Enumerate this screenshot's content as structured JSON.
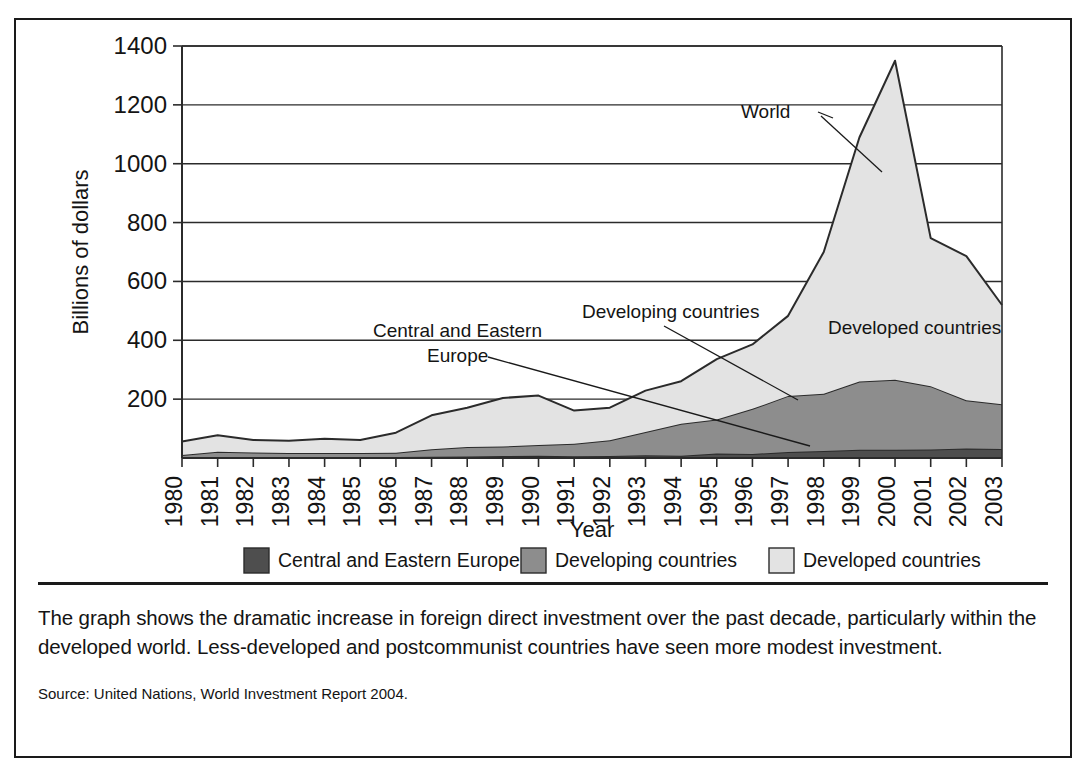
{
  "chart_data": {
    "type": "area",
    "stacked": true,
    "title": "",
    "xlabel": "Year",
    "ylabel": "Billions of dollars",
    "x": [
      1980,
      1981,
      1982,
      1983,
      1984,
      1985,
      1986,
      1987,
      1988,
      1989,
      1990,
      1991,
      1992,
      1993,
      1994,
      1995,
      1996,
      1997,
      1998,
      1999,
      2000,
      2001,
      2002,
      2003
    ],
    "xtick_labels": [
      "1980",
      "1981",
      "1982",
      "1983",
      "1984",
      "1985",
      "1986",
      "1987",
      "1988",
      "1989",
      "1990",
      "1991",
      "1992",
      "1993",
      "1994",
      "1995",
      "1996",
      "1997",
      "1998",
      "1999",
      "2000",
      "2001",
      "2002",
      "2003"
    ],
    "ytick_labels": [
      "200",
      "400",
      "600",
      "800",
      "1000",
      "1200",
      "1400"
    ],
    "yticks": [
      200,
      400,
      600,
      800,
      1000,
      1200,
      1400
    ],
    "ylim": [
      0,
      1400
    ],
    "grid": true,
    "legend_position": "bottom",
    "series": [
      {
        "name": "Central and Eastern Europe",
        "color": "#4e4e4e",
        "values": [
          2,
          3,
          3,
          3,
          3,
          3,
          3,
          4,
          5,
          7,
          8,
          6,
          7,
          9,
          8,
          15,
          14,
          20,
          24,
          28,
          28,
          29,
          32,
          31
        ]
      },
      {
        "name": "Developing countries",
        "color": "#8d8d8d",
        "values": [
          8,
          18,
          16,
          14,
          14,
          14,
          15,
          26,
          32,
          32,
          36,
          42,
          53,
          79,
          108,
          116,
          153,
          191,
          194,
          232,
          238,
          215,
          164,
          152
        ]
      },
      {
        "name": "Developed countries",
        "color": "#e3e3e3",
        "values": [
          46,
          56,
          42,
          42,
          48,
          44,
          68,
          115,
          134,
          165,
          168,
          113,
          111,
          141,
          145,
          205,
          219,
          272,
          482,
          829,
          1084,
          503,
          490,
          337
        ]
      }
    ],
    "totals": [
      56,
      77,
      61,
      59,
      65,
      61,
      86,
      145,
      171,
      204,
      212,
      161,
      171,
      229,
      261,
      336,
      386,
      483,
      700,
      1089,
      1350,
      747,
      686,
      520
    ],
    "annotations": [
      {
        "name": "world",
        "label": "World"
      },
      {
        "name": "developed-countries",
        "label": "Developed countries"
      },
      {
        "name": "developing-countries",
        "label": "Developing countries"
      },
      {
        "name": "central-eastern-europe-line1",
        "label": "Central and Eastern"
      },
      {
        "name": "central-eastern-europe-line2",
        "label": "Europe"
      }
    ],
    "legend": [
      {
        "label": "Central and Eastern Europe",
        "color": "#4e4e4e"
      },
      {
        "label": "Developing countries",
        "color": "#8d8d8d"
      },
      {
        "label": "Developed countries",
        "color": "#e3e3e3"
      }
    ]
  },
  "caption": {
    "body": "The graph shows the dramatic increase in foreign direct investment over the past decade, particularly within the developed world. Less-developed and postcommunist countries have seen more modest investment.",
    "source": "Source: United Nations, World Investment Report 2004."
  }
}
